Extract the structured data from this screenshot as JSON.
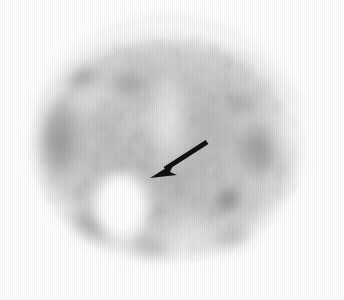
{
  "figure": {
    "caption": "",
    "background_color": "#ffffff",
    "width": 344,
    "height": 300,
    "modality_hint": "grayscale-nuclear-medicine-axial-slice",
    "alt_text": "Grayscale axial nuclear medicine brain slice with a black arrow pointing down and to the left toward a bright photopenic focus in the right hemisphere."
  },
  "top_rule": {
    "name": "horizontal-rule",
    "x": 0,
    "y": 3,
    "width": 337,
    "height": 2,
    "color": "#6f6f6f"
  },
  "scan": {
    "name": "axial-brain-slice",
    "center_x": 167,
    "center_y": 146,
    "radius_x": 148,
    "radius_y": 126,
    "background_color": "#ffffff",
    "tone_darkest": "#9a9a9a",
    "tone_mid": "#b8b8b8",
    "tone_light": "#dcdcdc",
    "tone_brightest": "#ffffff",
    "blobs": [
      {
        "name": "bright-photopenic-focus",
        "cx": 121,
        "cy": 206,
        "rx": 26,
        "ry": 32,
        "tone": "#ffffff",
        "opacity": 1.0
      },
      {
        "name": "bright-streak-upper-left",
        "cx": 96,
        "cy": 98,
        "rx": 20,
        "ry": 11,
        "tone": "#f4f4f4",
        "opacity": 0.95
      },
      {
        "name": "bright-streak-midline",
        "cx": 132,
        "cy": 122,
        "rx": 16,
        "ry": 9,
        "tone": "#f2f2f2",
        "opacity": 0.9
      },
      {
        "name": "bright-midline-band",
        "cx": 168,
        "cy": 120,
        "rx": 17,
        "ry": 58,
        "tone": "#ededed",
        "opacity": 0.85
      },
      {
        "name": "dark-focus-right-hemisphere",
        "cx": 228,
        "cy": 200,
        "rx": 20,
        "ry": 19,
        "tone": "#8e8e8e",
        "opacity": 0.95
      },
      {
        "name": "dark-band-left-cortex",
        "cx": 60,
        "cy": 140,
        "rx": 32,
        "ry": 62,
        "tone": "#a4a4a4",
        "opacity": 0.9
      },
      {
        "name": "dark-band-left-frontal",
        "cx": 82,
        "cy": 78,
        "rx": 30,
        "ry": 20,
        "tone": "#a8a8a8",
        "opacity": 0.85
      },
      {
        "name": "dark-band-anterior-midline",
        "cx": 128,
        "cy": 84,
        "rx": 36,
        "ry": 16,
        "tone": "#aeaeae",
        "opacity": 0.8
      },
      {
        "name": "dark-patch-left-inferior",
        "cx": 92,
        "cy": 228,
        "rx": 38,
        "ry": 30,
        "tone": "#a6a6a6",
        "opacity": 0.9
      },
      {
        "name": "dark-patch-right-lateral",
        "cx": 258,
        "cy": 150,
        "rx": 30,
        "ry": 44,
        "tone": "#b2b2b2",
        "opacity": 0.85
      },
      {
        "name": "dark-patch-right-posterior",
        "cx": 236,
        "cy": 244,
        "rx": 34,
        "ry": 24,
        "tone": "#aaaaaa",
        "opacity": 0.85
      },
      {
        "name": "dark-patch-right-frontal",
        "cx": 240,
        "cy": 104,
        "rx": 24,
        "ry": 16,
        "tone": "#bdbdbd",
        "opacity": 0.7
      },
      {
        "name": "dark-patch-central",
        "cx": 176,
        "cy": 176,
        "rx": 22,
        "ry": 18,
        "tone": "#bcbcbc",
        "opacity": 0.7
      },
      {
        "name": "dark-patch-left-posterior",
        "cx": 150,
        "cy": 250,
        "rx": 30,
        "ry": 20,
        "tone": "#b4b4b4",
        "opacity": 0.75
      }
    ]
  },
  "arrow": {
    "name": "annotation-arrow",
    "color": "#111111",
    "tail_x": 207,
    "tail_y": 142,
    "tip_x": 150,
    "tip_y": 178,
    "shaft_width": 5,
    "head_length": 20,
    "head_width": 17,
    "direction": "down-left",
    "points_to": "bright-photopenic-focus"
  }
}
